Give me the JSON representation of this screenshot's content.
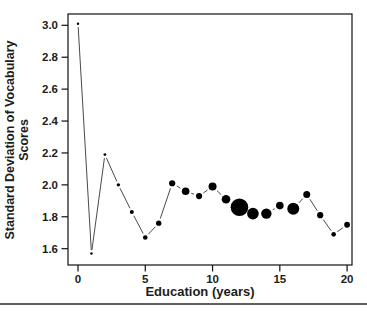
{
  "figure": {
    "xlabel": "Education (years)",
    "ylabel_line1": "Standard Deviation of Vocabulary",
    "ylabel_line2": "Scores"
  },
  "chart_data": {
    "type": "scatter",
    "title": "",
    "xlabel": "Education (years)",
    "ylabel": "Standard Deviation of Vocabulary Scores",
    "x": [
      0,
      1,
      2,
      3,
      4,
      5,
      6,
      7,
      8,
      9,
      10,
      11,
      12,
      13,
      14,
      15,
      16,
      17,
      18,
      19,
      20
    ],
    "series": [
      {
        "name": "sd-of-vocabulary-by-education",
        "values": [
          3.01,
          1.57,
          2.19,
          2.0,
          1.83,
          1.67,
          1.76,
          2.01,
          1.96,
          1.93,
          1.99,
          1.91,
          1.86,
          1.82,
          1.82,
          1.87,
          1.85,
          1.94,
          1.81,
          1.69,
          1.75
        ]
      }
    ],
    "marker_radii_px": [
      1.2,
      1.2,
      1.4,
      1.7,
      2.0,
      2.3,
      2.7,
      3.1,
      3.8,
      3.1,
      4.0,
      4.3,
      8.8,
      5.8,
      5.2,
      3.8,
      6.0,
      3.5,
      3.1,
      2.3,
      2.9
    ],
    "marker_size_meaning": "point size varies with group size; largest at 12 years",
    "xticks": [
      0,
      5,
      10,
      15,
      20
    ],
    "yticks": [
      3.0,
      2.8,
      2.6,
      2.4,
      2.2,
      2.0,
      1.8,
      1.6
    ],
    "xlim": [
      -0.75,
      20.4
    ],
    "ylim": [
      1.49,
      3.07
    ],
    "grid": false,
    "legend": "none",
    "marker_color": "#000000",
    "line_color": "#4a4a4a",
    "frame_color": "#111111",
    "connector_style": "point-to-point segments with gaps around markers"
  },
  "page": {
    "divider_color": "#2b2b2b"
  }
}
